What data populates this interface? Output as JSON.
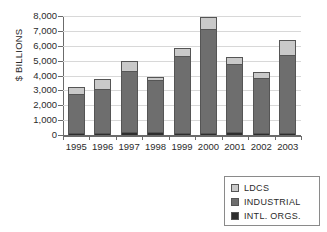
{
  "chart_data": {
    "type": "bar",
    "stacked": true,
    "title": "",
    "subtitle": "",
    "xlabel": "",
    "ylabel": "$ BILLIONS",
    "categories": [
      "1995",
      "1996",
      "1997",
      "1998",
      "1999",
      "2000",
      "2001",
      "2002",
      "2003"
    ],
    "ylim": [
      0,
      8000
    ],
    "ytick_labels": [
      "8,000",
      "7,000",
      "6,000",
      "5,000",
      "4,000",
      "3,000",
      "2,000",
      "1,000",
      "0"
    ],
    "ytick_values": [
      8000,
      7000,
      6000,
      5000,
      4000,
      3000,
      2000,
      1000,
      0
    ],
    "grid": true,
    "legend_position": "bottom-right",
    "series": [
      {
        "name": "LDCS",
        "color": "#c9c9c9",
        "values": [
          520,
          680,
          680,
          170,
          560,
          840,
          500,
          460,
          1000
        ]
      },
      {
        "name": "INDUSTRIAL",
        "color": "#6e6e6e",
        "values": [
          2600,
          2950,
          4150,
          3500,
          5130,
          6960,
          4600,
          3660,
          5250
        ]
      },
      {
        "name": "INTL. ORGS.",
        "color": "#2e2e2e",
        "values": [
          130,
          150,
          170,
          220,
          160,
          150,
          170,
          140,
          160
        ]
      }
    ],
    "totals": [
      3250,
      3780,
      5000,
      3890,
      5850,
      7950,
      5270,
      4260,
      6410
    ]
  },
  "legend": {
    "items": [
      {
        "label": "LDCS",
        "color": "#c9c9c9"
      },
      {
        "label": "INDUSTRIAL",
        "color": "#6e6e6e"
      },
      {
        "label": "INTL. ORGS.",
        "color": "#2e2e2e"
      }
    ]
  }
}
